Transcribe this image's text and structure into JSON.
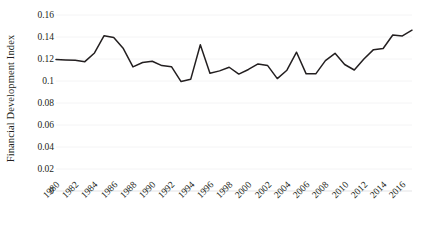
{
  "chart_data": {
    "type": "line",
    "title": "",
    "xlabel": "",
    "ylabel": "Financial Development Index",
    "ylim": [
      0,
      0.16
    ],
    "xlim": [
      1980,
      2017
    ],
    "grid": true,
    "legend": false,
    "y_ticks": [
      "0",
      "0.02",
      "0.04",
      "0.06",
      "0.08",
      "0.1",
      "0.12",
      "0.14",
      "0.16"
    ],
    "y_tick_values": [
      0,
      0.02,
      0.04,
      0.06,
      0.08,
      0.1,
      0.12,
      0.14,
      0.16
    ],
    "x_ticks": [
      "1980",
      "1982",
      "1984",
      "1986",
      "1988",
      "1990",
      "1992",
      "1994",
      "1996",
      "1998",
      "2000",
      "2002",
      "2004",
      "2006",
      "2008",
      "2010",
      "2012",
      "2014",
      "2016"
    ],
    "x": [
      1980,
      1981,
      1982,
      1983,
      1984,
      1985,
      1986,
      1987,
      1988,
      1989,
      1990,
      1991,
      1992,
      1993,
      1994,
      1995,
      1996,
      1997,
      1998,
      1999,
      2000,
      2001,
      2002,
      2003,
      2004,
      2005,
      2006,
      2007,
      2008,
      2009,
      2010,
      2011,
      2012,
      2013,
      2014,
      2015,
      2016,
      2017
    ],
    "series": [
      {
        "name": "Financial Development Index",
        "color": "#231f20",
        "values": [
          0.1195,
          0.1192,
          0.1188,
          0.1176,
          0.1255,
          0.1412,
          0.1395,
          0.1295,
          0.1128,
          0.1168,
          0.118,
          0.114,
          0.113,
          0.0995,
          0.1015,
          0.133,
          0.107,
          0.1092,
          0.1125,
          0.1063,
          0.1105,
          0.1155,
          0.114,
          0.1022,
          0.1098,
          0.1262,
          0.1065,
          0.1065,
          0.1185,
          0.1252,
          0.115,
          0.11,
          0.12,
          0.1285,
          0.1295,
          0.1418,
          0.141,
          0.1462
        ]
      }
    ]
  }
}
